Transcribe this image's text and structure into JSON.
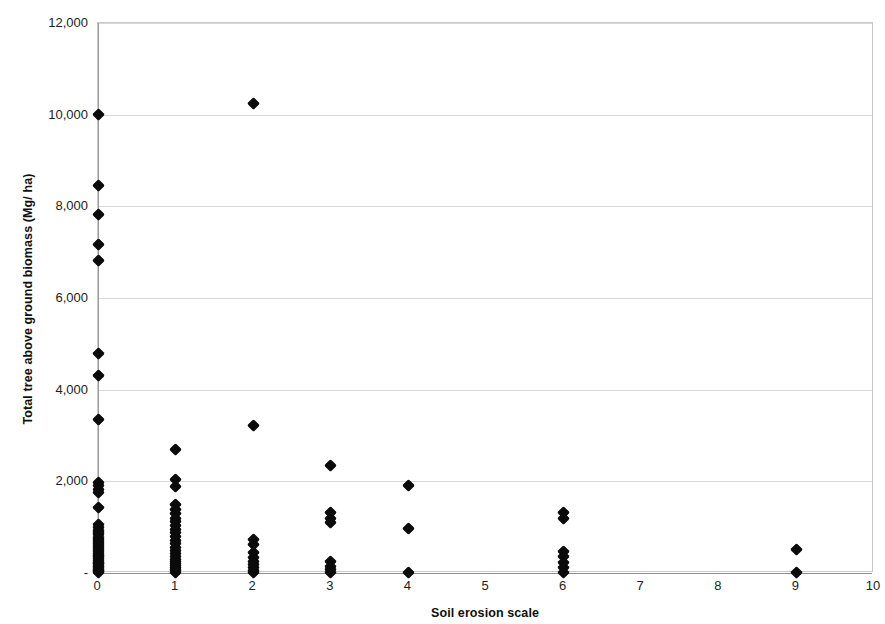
{
  "chart_data": {
    "type": "scatter",
    "title": "",
    "xlabel": "Soil erosion scale",
    "ylabel": "Total tree above ground biomass (Mg/ ha)",
    "xlim": [
      0,
      10
    ],
    "ylim": [
      0,
      12000
    ],
    "xticks": [
      "0",
      "1",
      "2",
      "3",
      "4",
      "5",
      "6",
      "7",
      "8",
      "9",
      "10"
    ],
    "xtick_values": [
      0,
      1,
      2,
      3,
      4,
      5,
      6,
      7,
      8,
      9,
      10
    ],
    "yticks": [
      "-",
      "2,000",
      "4,000",
      "6,000",
      "8,000",
      "10,000",
      "12,000"
    ],
    "ytick_values": [
      0,
      2000,
      4000,
      6000,
      8000,
      10000,
      12000
    ],
    "grid": "horizontal",
    "legend": "none",
    "marker": "diamond",
    "marker_color": "#0b0b0b",
    "points": [
      {
        "x": 0,
        "y": 10000
      },
      {
        "x": 0,
        "y": 8450
      },
      {
        "x": 0,
        "y": 7830
      },
      {
        "x": 0,
        "y": 7160
      },
      {
        "x": 0,
        "y": 6810
      },
      {
        "x": 0,
        "y": 4780
      },
      {
        "x": 0,
        "y": 4300
      },
      {
        "x": 0,
        "y": 3340
      },
      {
        "x": 0,
        "y": 1980
      },
      {
        "x": 0,
        "y": 1900
      },
      {
        "x": 0,
        "y": 1830
      },
      {
        "x": 0,
        "y": 1760
      },
      {
        "x": 0,
        "y": 1430
      },
      {
        "x": 0,
        "y": 1050
      },
      {
        "x": 0,
        "y": 990
      },
      {
        "x": 0,
        "y": 930
      },
      {
        "x": 0,
        "y": 880
      },
      {
        "x": 0,
        "y": 830
      },
      {
        "x": 0,
        "y": 780
      },
      {
        "x": 0,
        "y": 730
      },
      {
        "x": 0,
        "y": 690
      },
      {
        "x": 0,
        "y": 640
      },
      {
        "x": 0,
        "y": 600
      },
      {
        "x": 0,
        "y": 560
      },
      {
        "x": 0,
        "y": 510
      },
      {
        "x": 0,
        "y": 470
      },
      {
        "x": 0,
        "y": 430
      },
      {
        "x": 0,
        "y": 390
      },
      {
        "x": 0,
        "y": 350
      },
      {
        "x": 0,
        "y": 310
      },
      {
        "x": 0,
        "y": 275
      },
      {
        "x": 0,
        "y": 240
      },
      {
        "x": 0,
        "y": 205
      },
      {
        "x": 0,
        "y": 175
      },
      {
        "x": 0,
        "y": 145
      },
      {
        "x": 0,
        "y": 115
      },
      {
        "x": 0,
        "y": 85
      },
      {
        "x": 0,
        "y": 55
      },
      {
        "x": 0,
        "y": 30
      },
      {
        "x": 0,
        "y": 10
      },
      {
        "x": 1,
        "y": 2700
      },
      {
        "x": 1,
        "y": 2050
      },
      {
        "x": 1,
        "y": 1890
      },
      {
        "x": 1,
        "y": 1490
      },
      {
        "x": 1,
        "y": 1380
      },
      {
        "x": 1,
        "y": 1290
      },
      {
        "x": 1,
        "y": 1200
      },
      {
        "x": 1,
        "y": 1120
      },
      {
        "x": 1,
        "y": 1040
      },
      {
        "x": 1,
        "y": 960
      },
      {
        "x": 1,
        "y": 880
      },
      {
        "x": 1,
        "y": 800
      },
      {
        "x": 1,
        "y": 720
      },
      {
        "x": 1,
        "y": 640
      },
      {
        "x": 1,
        "y": 560
      },
      {
        "x": 1,
        "y": 490
      },
      {
        "x": 1,
        "y": 420
      },
      {
        "x": 1,
        "y": 360
      },
      {
        "x": 1,
        "y": 300
      },
      {
        "x": 1,
        "y": 250
      },
      {
        "x": 1,
        "y": 200
      },
      {
        "x": 1,
        "y": 155
      },
      {
        "x": 1,
        "y": 115
      },
      {
        "x": 1,
        "y": 80
      },
      {
        "x": 1,
        "y": 45
      },
      {
        "x": 1,
        "y": 15
      },
      {
        "x": 2,
        "y": 10250
      },
      {
        "x": 2,
        "y": 3210
      },
      {
        "x": 2,
        "y": 740
      },
      {
        "x": 2,
        "y": 620
      },
      {
        "x": 2,
        "y": 440
      },
      {
        "x": 2,
        "y": 330
      },
      {
        "x": 2,
        "y": 260
      },
      {
        "x": 2,
        "y": 180
      },
      {
        "x": 2,
        "y": 110
      },
      {
        "x": 2,
        "y": 50
      },
      {
        "x": 2,
        "y": 15
      },
      {
        "x": 3,
        "y": 2340
      },
      {
        "x": 3,
        "y": 1310
      },
      {
        "x": 3,
        "y": 1180
      },
      {
        "x": 3,
        "y": 1110
      },
      {
        "x": 3,
        "y": 250
      },
      {
        "x": 3,
        "y": 150
      },
      {
        "x": 3,
        "y": 70
      },
      {
        "x": 3,
        "y": 15
      },
      {
        "x": 4,
        "y": 1900
      },
      {
        "x": 4,
        "y": 980
      },
      {
        "x": 4,
        "y": 20
      },
      {
        "x": 6,
        "y": 1320
      },
      {
        "x": 6,
        "y": 1200
      },
      {
        "x": 6,
        "y": 470
      },
      {
        "x": 6,
        "y": 350
      },
      {
        "x": 6,
        "y": 230
      },
      {
        "x": 6,
        "y": 110
      },
      {
        "x": 6,
        "y": 20
      },
      {
        "x": 9,
        "y": 510
      },
      {
        "x": 9,
        "y": 20
      }
    ]
  }
}
